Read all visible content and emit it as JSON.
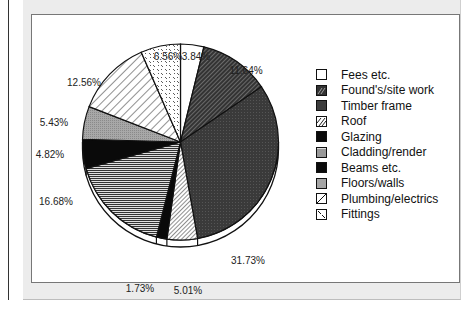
{
  "chart_data": {
    "type": "pie",
    "title": "",
    "start_angle": "12 o'clock, clockwise",
    "legend_position": "right",
    "categories": [
      "Fees etc.",
      "Found's/site work",
      "Timber frame",
      "Roof",
      "Glazing",
      "Cladding/render",
      "Beams etc.",
      "Floors/walls",
      "Plumbing/electrics",
      "Fittings"
    ],
    "values": [
      3.84,
      11.64,
      31.73,
      5.01,
      1.73,
      16.68,
      4.82,
      5.43,
      12.56,
      6.56
    ],
    "labels": [
      "3.84%",
      "11.64%",
      "31.73%",
      "5.01%",
      "1.73%",
      "16.68%",
      "4.82%",
      "5.43%",
      "12.56%",
      "6.56%"
    ],
    "patterns": [
      "white",
      "dark-diagonal-hatch",
      "dark-gray-dots",
      "light-diagonal-hatch",
      "black",
      "horizontal-lines",
      "black",
      "light-gray-dots",
      "wide-diagonal-hatch",
      "dashed-texture"
    ],
    "unit": "%"
  },
  "legend": {
    "items": [
      {
        "label": "Fees etc.",
        "pattern": "white"
      },
      {
        "label": "Found's/site work",
        "pattern": "dark-diagonal-hatch"
      },
      {
        "label": "Timber frame",
        "pattern": "dark-gray-dots"
      },
      {
        "label": "Roof",
        "pattern": "light-diagonal-hatch"
      },
      {
        "label": "Glazing",
        "pattern": "black"
      },
      {
        "label": "Cladding/render",
        "pattern": "horizontal-lines"
      },
      {
        "label": "Beams etc.",
        "pattern": "black"
      },
      {
        "label": "Floors/walls",
        "pattern": "light-gray-dots"
      },
      {
        "label": "Plumbing/electrics",
        "pattern": "wide-diagonal-hatch"
      },
      {
        "label": "Fittings",
        "pattern": "dashed-texture"
      }
    ]
  },
  "colors": {
    "outline": "#111111",
    "timber": "#3a3a3a",
    "floors": "#9a9a9a",
    "panel": "#ececec"
  }
}
